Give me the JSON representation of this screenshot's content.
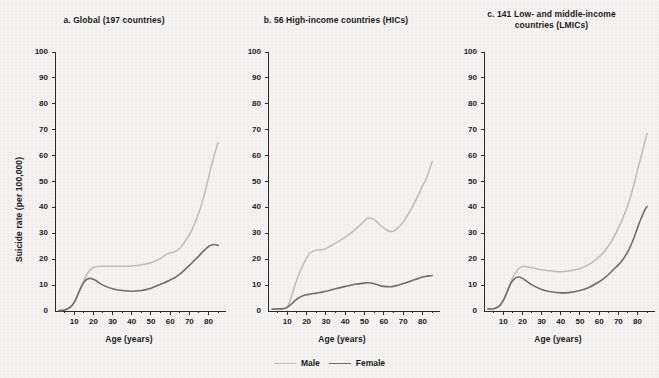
{
  "figure": {
    "background": "#f4f3f1",
    "ylabel": "Suicide rate (per 100,000)",
    "xlabel": "Age (years)"
  },
  "legend": {
    "position": "bottom-center",
    "items": [
      {
        "label": "Male",
        "color": "#bdbdbd"
      },
      {
        "label": "Female",
        "color": "#6f6f6f"
      }
    ]
  },
  "chart_data": [
    {
      "type": "line",
      "title": "a. Global (197 countries)",
      "xlabel": "Age (years)",
      "ylabel": "Suicide rate (per 100,000)",
      "xlim": [
        0,
        87
      ],
      "ylim": [
        0,
        100
      ],
      "xticks": [
        10,
        20,
        30,
        40,
        50,
        60,
        70,
        80
      ],
      "yticks": [
        0,
        10,
        20,
        30,
        40,
        50,
        60,
        70,
        80,
        90,
        100
      ],
      "minor_xtick_interval": 5,
      "grid": false,
      "x": [
        2,
        5,
        8,
        10,
        12,
        14,
        16,
        18,
        20,
        22,
        25,
        30,
        35,
        40,
        45,
        50,
        55,
        57,
        60,
        62,
        65,
        70,
        72,
        75,
        78,
        80,
        82,
        84,
        85
      ],
      "series": [
        {
          "name": "Male",
          "color": "#bdbdbd",
          "values": [
            0.2,
            0.4,
            1.6,
            3.4,
            6.4,
            10.0,
            13.3,
            15.6,
            16.8,
            17.2,
            17.3,
            17.3,
            17.3,
            17.4,
            17.8,
            18.6,
            20.3,
            21.4,
            22.5,
            22.8,
            24.2,
            29.5,
            32.5,
            38.0,
            45.5,
            51.5,
            57.5,
            62.8,
            65.0
          ]
        },
        {
          "name": "Female",
          "color": "#6f6f6f",
          "values": [
            0.2,
            0.4,
            1.5,
            3.3,
            6.5,
            9.8,
            11.9,
            12.6,
            12.3,
            11.4,
            10.0,
            8.6,
            7.9,
            7.6,
            7.9,
            8.8,
            10.3,
            10.9,
            12.0,
            12.7,
            14.2,
            17.6,
            19.1,
            21.3,
            23.6,
            24.9,
            25.6,
            25.6,
            25.3
          ]
        }
      ]
    },
    {
      "type": "line",
      "title": "b. 56 High-income countries (HICs)",
      "xlabel": "Age (years)",
      "ylabel": "Suicide rate (per 100,000)",
      "xlim": [
        0,
        87
      ],
      "ylim": [
        0,
        100
      ],
      "xticks": [
        10,
        20,
        30,
        40,
        50,
        60,
        70,
        80
      ],
      "yticks": [
        0,
        10,
        20,
        30,
        40,
        50,
        60,
        70,
        80,
        90,
        100
      ],
      "minor_xtick_interval": 5,
      "grid": false,
      "x": [
        2,
        5,
        8,
        10,
        12,
        14,
        16,
        18,
        20,
        22,
        25,
        28,
        30,
        35,
        40,
        45,
        50,
        52,
        55,
        58,
        60,
        62,
        64,
        66,
        70,
        74,
        78,
        80,
        82,
        84,
        85
      ],
      "series": [
        {
          "name": "Male",
          "color": "#bdbdbd",
          "values": [
            0.7,
            0.8,
            1.0,
            1.6,
            5.2,
            10.0,
            14.2,
            17.5,
            20.4,
            22.6,
            23.5,
            23.6,
            24.1,
            26.2,
            28.5,
            31.3,
            34.8,
            35.9,
            35.3,
            33.2,
            32.0,
            31.0,
            30.7,
            31.2,
            34.3,
            39.1,
            45.0,
            48.3,
            51.0,
            55.5,
            57.7
          ]
        },
        {
          "name": "Female",
          "color": "#6f6f6f",
          "values": [
            0.7,
            0.8,
            0.9,
            1.4,
            2.6,
            4.0,
            5.1,
            5.9,
            6.3,
            6.5,
            6.9,
            7.3,
            7.6,
            8.6,
            9.5,
            10.3,
            10.8,
            10.9,
            10.5,
            9.8,
            9.5,
            9.4,
            9.4,
            9.7,
            10.6,
            11.6,
            12.6,
            13.1,
            13.4,
            13.6,
            13.7
          ]
        }
      ]
    },
    {
      "type": "line",
      "title": "c. 141 Low- and middle-income countries (LMICs)",
      "xlabel": "Age (years)",
      "ylabel": "Suicide rate (per 100,000)",
      "xlim": [
        0,
        87
      ],
      "ylim": [
        0,
        100
      ],
      "xticks": [
        10,
        20,
        30,
        40,
        50,
        60,
        70,
        80
      ],
      "yticks": [
        0,
        10,
        20,
        30,
        40,
        50,
        60,
        70,
        80,
        90,
        100
      ],
      "minor_xtick_interval": 5,
      "grid": false,
      "x": [
        2,
        5,
        8,
        10,
        12,
        14,
        16,
        18,
        20,
        22,
        25,
        30,
        35,
        40,
        45,
        50,
        55,
        60,
        62,
        65,
        68,
        70,
        72,
        75,
        78,
        80,
        82,
        84,
        85
      ],
      "series": [
        {
          "name": "Male",
          "color": "#bdbdbd",
          "values": [
            0.8,
            0.9,
            2.0,
            4.0,
            7.4,
            11.3,
            14.3,
            16.3,
            17.2,
            17.1,
            16.7,
            15.9,
            15.4,
            15.2,
            15.5,
            16.4,
            18.1,
            21.0,
            22.4,
            25.3,
            29.0,
            32.0,
            35.2,
            41.0,
            48.5,
            54.5,
            60.0,
            66.0,
            68.6
          ]
        },
        {
          "name": "Female",
          "color": "#6f6f6f",
          "values": [
            0.8,
            0.9,
            1.9,
            4.0,
            7.3,
            10.7,
            12.5,
            13.1,
            12.6,
            11.6,
            10.1,
            8.3,
            7.4,
            7.0,
            7.2,
            7.9,
            9.2,
            11.3,
            12.3,
            14.2,
            16.4,
            17.8,
            19.5,
            23.0,
            28.0,
            32.2,
            36.0,
            39.3,
            40.4
          ]
        }
      ]
    }
  ]
}
